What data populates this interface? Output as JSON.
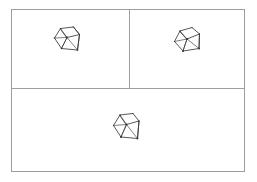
{
  "figure": {
    "background_color": "#ffffff",
    "frame_color": "#9d9d9d",
    "wire_color": "#3a3a3a",
    "width_px": 257,
    "height_px": 182,
    "frame": {
      "left": 11,
      "top": 9,
      "width": 234,
      "height": 163
    },
    "divider_vertical_x": 129,
    "divider_horizontal_y": 88
  },
  "panels": [
    {
      "id": "panel-top-left",
      "label": "",
      "position": "top-left",
      "bounds": {
        "left": 11,
        "top": 9,
        "width": 118,
        "height": 79
      },
      "shape": {
        "name": "wireframe-polyhedron",
        "kind": "cube-frustum-wireframe",
        "orientation": "view-a",
        "center": {
          "x": 67,
          "y": 45
        },
        "size_px": 28,
        "stroke_color": "#3a3a3a",
        "vertex_count": 8,
        "edge_count": 12
      }
    },
    {
      "id": "panel-top-right",
      "label": "",
      "position": "top-right",
      "bounds": {
        "left": 130,
        "top": 9,
        "width": 115,
        "height": 79
      },
      "shape": {
        "name": "wireframe-polyhedron",
        "kind": "cube-frustum-wireframe",
        "orientation": "view-b",
        "center": {
          "x": 189,
          "y": 46
        },
        "size_px": 28,
        "stroke_color": "#3a3a3a",
        "vertex_count": 8,
        "edge_count": 12
      }
    },
    {
      "id": "panel-bottom",
      "label": "",
      "position": "bottom-full-width",
      "bounds": {
        "left": 11,
        "top": 89,
        "width": 234,
        "height": 83
      },
      "shape": {
        "name": "wireframe-polyhedron",
        "kind": "cube-frustum-wireframe",
        "orientation": "view-c",
        "center": {
          "x": 127,
          "y": 133
        },
        "size_px": 30,
        "stroke_color": "#3a3a3a",
        "vertex_count": 8,
        "edge_count": 12
      }
    }
  ],
  "chart_data": {
    "type": "table",
    "xlabel": "",
    "ylabel": "",
    "categories": [
      "panel-top-left",
      "panel-top-right",
      "panel-bottom"
    ],
    "values": [
      1,
      1,
      1
    ]
  }
}
